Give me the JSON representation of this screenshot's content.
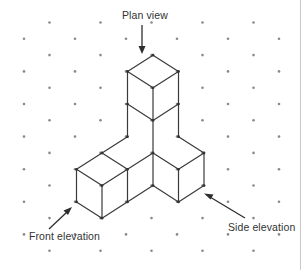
{
  "figure": {
    "labels": {
      "plan_view": "Plan view",
      "front_elevation": "Front elevation",
      "side_elevation": "Side elevation"
    },
    "colors": {
      "lines": "#3a3a3a",
      "dots": "#8a8a8a",
      "text": "#333333",
      "background": "#ffffff"
    },
    "grid": {
      "type": "isometric dot grid",
      "columns": 11,
      "rows_per_column": 8
    },
    "solid": {
      "cube_count": 5,
      "description": "Two-cube vertical stack at the back corner, one cube extending to the front-left (2 cubes long) and one cube extending to the right",
      "cubes_iso": [
        {
          "x": 0,
          "y": 0,
          "z": 0
        },
        {
          "x": 0,
          "y": 0,
          "z": 1
        },
        {
          "x": 0,
          "y": 0,
          "z": 2
        },
        {
          "x": 1,
          "y": 0,
          "z": 0
        },
        {
          "x": 2,
          "y": 0,
          "z": 0
        },
        {
          "x": 0,
          "y": 1,
          "z": 0
        }
      ]
    },
    "arrows": [
      {
        "label_ref": "plan_view",
        "direction": "down"
      },
      {
        "label_ref": "front_elevation",
        "direction": "up-right"
      },
      {
        "label_ref": "side_elevation",
        "direction": "up-left"
      }
    ]
  }
}
